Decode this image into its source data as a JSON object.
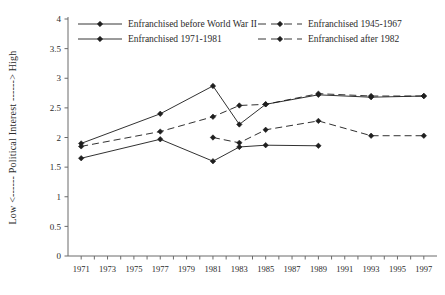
{
  "chart_data": {
    "type": "line",
    "title": "",
    "subtitle": "",
    "xlabel": "",
    "ylabel": "Low <------ Political Interest ------> High",
    "ylabel_low": "Low",
    "ylabel_high": "High",
    "ylabel_main": "Political Interest",
    "xlim": [
      1970,
      1998
    ],
    "ylim": [
      0,
      4
    ],
    "yticks": [
      0,
      0.5,
      1,
      1.5,
      2,
      2.5,
      3,
      3.5,
      4
    ],
    "ytick_labels": [
      "0",
      "0.5",
      "1",
      "1.5",
      "2",
      "2.5",
      "3",
      "3.5",
      "4"
    ],
    "xticks": [
      1971,
      1972,
      1973,
      1974,
      1975,
      1976,
      1977,
      1978,
      1979,
      1980,
      1981,
      1982,
      1983,
      1984,
      1985,
      1986,
      1987,
      1988,
      1989,
      1990,
      1991,
      1992,
      1993,
      1994,
      1995,
      1996,
      1997
    ],
    "xtick_labels": [
      "1971",
      "",
      "1973",
      "",
      "1975",
      "",
      "1977",
      "",
      "1979",
      "",
      "1981",
      "",
      "1983",
      "",
      "1985",
      "",
      "1987",
      "",
      "1989",
      "",
      "1991",
      "",
      "1993",
      "",
      "1995",
      "",
      "1997"
    ],
    "grid": false,
    "legend_position": "top",
    "marker": "filled-diamond",
    "series": [
      {
        "name": "Enfranchised before World War II",
        "legend_key": "enfranchised-before-wwii",
        "style": "solid",
        "color": "#1a1a1a",
        "x": [
          1971,
          1977,
          1981,
          1983,
          1985,
          1989,
          1993,
          1997
        ],
        "y": [
          1.9,
          2.4,
          2.87,
          2.22,
          2.56,
          2.72,
          2.68,
          2.7
        ]
      },
      {
        "name": "Enfranchised 1945-1967",
        "legend_key": "enfranchised-1945-1967",
        "style": "dashed",
        "color": "#1a1a1a",
        "x": [
          1971,
          1977,
          1981,
          1983,
          1985,
          1989,
          1993,
          1997
        ],
        "y": [
          1.85,
          2.1,
          2.35,
          2.54,
          2.56,
          2.74,
          2.7,
          2.7
        ]
      },
      {
        "name": "Enfranchised 1971-1981",
        "legend_key": "enfranchised-1971-1981",
        "style": "solid",
        "color": "#1a1a1a",
        "x": [
          1971,
          1977,
          1981,
          1983,
          1985,
          1989
        ],
        "y": [
          1.65,
          1.97,
          1.6,
          1.84,
          1.87,
          1.86
        ]
      },
      {
        "name": "Enfranchised after 1982",
        "legend_key": "enfranchised-after-1982",
        "style": "dashed",
        "color": "#1a1a1a",
        "x": [
          1981,
          1983,
          1985,
          1989,
          1993,
          1997
        ],
        "y": [
          2.0,
          1.91,
          2.13,
          2.28,
          2.03,
          2.03
        ]
      }
    ]
  },
  "legend": {
    "entries": [
      {
        "label": "Enfranchised before World War II",
        "style": "solid",
        "column": 0,
        "row": 0
      },
      {
        "label": "Enfranchised 1945-1967",
        "style": "dashed",
        "column": 1,
        "row": 0
      },
      {
        "label": "Enfranchised 1971-1981",
        "style": "solid",
        "column": 0,
        "row": 1
      },
      {
        "label": "Enfranchised after 1982",
        "style": "dashed",
        "column": 1,
        "row": 1
      }
    ]
  },
  "colors": {
    "axis": "#6b6b6b",
    "line": "#1f1f1f",
    "text": "#2b2b2b",
    "background": "#ffffff"
  }
}
